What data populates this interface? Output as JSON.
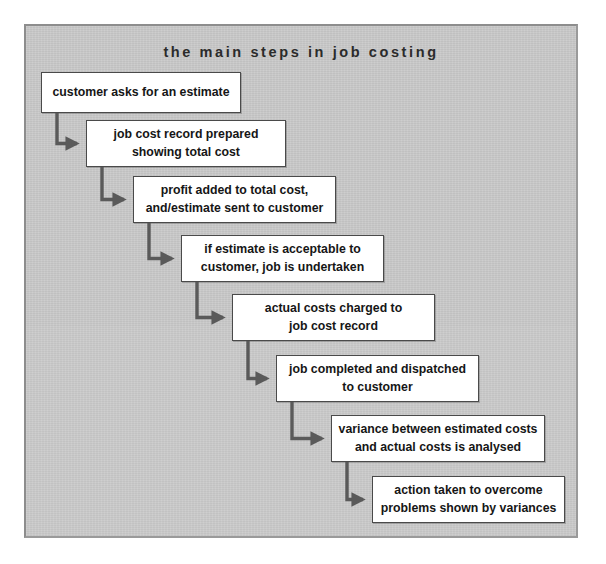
{
  "panel": {
    "background_color": "#c9c9c9",
    "border_color": "#8d8d8d"
  },
  "diagram": {
    "title": "the main steps in job costing",
    "type": "flowchart-staircase",
    "box_fill_color": "#ffffff",
    "box_border_color": "#4a4a4a",
    "connector_color": "#5a5a5a",
    "steps": [
      {
        "id": "step-1",
        "order": 1,
        "lines": [
          "customer asks for an estimate"
        ],
        "x": 41,
        "y": 72,
        "width": 200,
        "height": 41
      },
      {
        "id": "step-2",
        "order": 2,
        "lines": [
          "job cost record prepared",
          "showing total cost"
        ],
        "x": 86,
        "y": 120,
        "width": 200,
        "height": 47
      },
      {
        "id": "step-3",
        "order": 3,
        "lines": [
          "profit added to total cost,",
          "and/estimate sent to customer"
        ],
        "x": 133,
        "y": 176,
        "width": 203,
        "height": 47
      },
      {
        "id": "step-4",
        "order": 4,
        "lines": [
          "if estimate is acceptable to",
          "customer, job is undertaken"
        ],
        "x": 181,
        "y": 235,
        "width": 203,
        "height": 47
      },
      {
        "id": "step-5",
        "order": 5,
        "lines": [
          "actual costs charged to",
          "job cost record"
        ],
        "x": 232,
        "y": 294,
        "width": 203,
        "height": 47
      },
      {
        "id": "step-6",
        "order": 6,
        "lines": [
          "job completed and dispatched",
          "to customer"
        ],
        "x": 276,
        "y": 355,
        "width": 203,
        "height": 47
      },
      {
        "id": "step-7",
        "order": 7,
        "lines": [
          "variance between estimated costs",
          "and actual costs is analysed"
        ],
        "x": 331,
        "y": 415,
        "width": 214,
        "height": 47
      },
      {
        "id": "step-8",
        "order": 8,
        "lines": [
          "action taken to overcome",
          "problems shown by variances"
        ],
        "x": 372,
        "y": 476,
        "width": 193,
        "height": 47
      }
    ],
    "connectors": [
      {
        "id": "connector-1-2",
        "from": "step-1",
        "to": "step-2"
      },
      {
        "id": "connector-2-3",
        "from": "step-2",
        "to": "step-3"
      },
      {
        "id": "connector-3-4",
        "from": "step-3",
        "to": "step-4"
      },
      {
        "id": "connector-4-5",
        "from": "step-4",
        "to": "step-5"
      },
      {
        "id": "connector-5-6",
        "from": "step-5",
        "to": "step-6"
      },
      {
        "id": "connector-6-7",
        "from": "step-6",
        "to": "step-7"
      },
      {
        "id": "connector-7-8",
        "from": "step-7",
        "to": "step-8"
      }
    ]
  }
}
